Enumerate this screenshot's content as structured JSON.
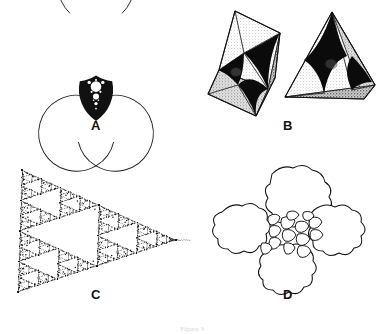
{
  "figure": {
    "caption": "Figure 3",
    "background_color": "#ffffff",
    "ink_color": "#000000",
    "panels": [
      {
        "id": "a",
        "label": "A",
        "subject": "three mutually tangent circles with nested curvilinear-triangle gasket",
        "element_count": 3
      },
      {
        "id": "b",
        "label": "B",
        "subject": "octahedron and tetrahedron with concave black curved-triangle faces",
        "element_count": 2
      },
      {
        "id": "c",
        "label": "C",
        "subject": "dotted fractal limit set forming a concave curvilinear triangle",
        "element_count": 1
      },
      {
        "id": "d",
        "label": "D",
        "subject": "irregular blob packing with small interstitial cells",
        "element_count": 4
      }
    ]
  },
  "chart_data": {
    "type": "diagram",
    "title": "Figure 3",
    "panel_labels": [
      "A",
      "B",
      "C",
      "D"
    ],
    "panel_a": {
      "type": "circle-packing",
      "circles": [
        {
          "cx": 96,
          "cy": 46,
          "r": 38
        },
        {
          "cx": 63,
          "cy": 103,
          "r": 38
        },
        {
          "cx": 129,
          "cy": 103,
          "r": 38
        }
      ],
      "arc_gap_degrees": 34,
      "gasket_depth": 3
    },
    "panel_b": {
      "type": "polyhedra",
      "solids": [
        "octahedron",
        "tetrahedron"
      ],
      "face_fill": "#000000",
      "shading": "stipple"
    },
    "panel_c": {
      "type": "fractal-limit-set",
      "vertices": [
        [
          22,
          20
        ],
        [
          18,
          142
        ],
        [
          176,
          90
        ]
      ],
      "iterations": 5,
      "dot_radius": 0.75
    },
    "panel_d": {
      "type": "blob-packing",
      "large_blobs": 4,
      "small_cells": 14
    }
  }
}
